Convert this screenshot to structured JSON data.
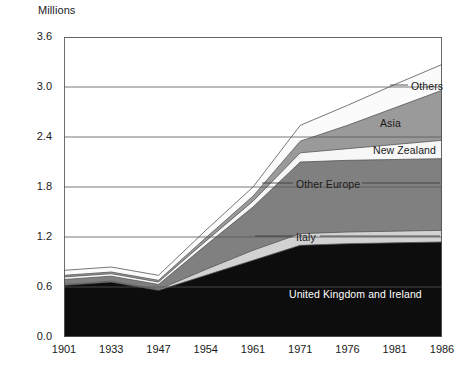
{
  "axis_unit_label": "Millions",
  "y_ticks": [
    "0.0",
    "0.6",
    "1.2",
    "1.8",
    "2.4",
    "3.0",
    "3.6"
  ],
  "x_ticks": [
    "1901",
    "1933",
    "1947",
    "1954",
    "1961",
    "1971",
    "1976",
    "1981",
    "1986"
  ],
  "series_labels": {
    "uk_ireland": "United Kingdom and Ireland",
    "italy": "Italy",
    "other_europe": "Other Europe",
    "new_zealand": "New Zealand",
    "asia": "Asia",
    "others": "Others"
  },
  "colors": {
    "uk_ireland": "#0d0d0d",
    "italy": "#d2d2d2",
    "other_europe": "#808080",
    "new_zealand": "#f7f7f7",
    "asia": "#9a9a9a",
    "others": "#fbfbfb",
    "gridline": "#555555",
    "axis": "#555555",
    "outline": "#555555"
  },
  "chart_data": {
    "type": "area",
    "stacked": true,
    "title": "",
    "subtitle": "",
    "xlabel": "",
    "ylabel": "Millions",
    "ylim": [
      0.0,
      3.6
    ],
    "ytick_step": 0.6,
    "grid": true,
    "legend": "inline-annotations",
    "categories": [
      "1901",
      "1933",
      "1947",
      "1954",
      "1961",
      "1971",
      "1976",
      "1981",
      "1986"
    ],
    "series": [
      {
        "name": "United Kingdom and Ireland",
        "values": [
          0.62,
          0.66,
          0.56,
          0.74,
          0.92,
          1.1,
          1.12,
          1.13,
          1.14
        ]
      },
      {
        "name": "Italy",
        "values": [
          0.01,
          0.01,
          0.01,
          0.07,
          0.12,
          0.14,
          0.14,
          0.14,
          0.14
        ]
      },
      {
        "name": "Other Europe",
        "values": [
          0.06,
          0.06,
          0.06,
          0.29,
          0.52,
          0.86,
          0.86,
          0.86,
          0.86
        ]
      },
      {
        "name": "New Zealand",
        "values": [
          0.03,
          0.03,
          0.03,
          0.05,
          0.07,
          0.11,
          0.14,
          0.18,
          0.22
        ]
      },
      {
        "name": "Asia",
        "values": [
          0.02,
          0.02,
          0.02,
          0.04,
          0.06,
          0.14,
          0.28,
          0.44,
          0.6
        ]
      },
      {
        "name": "Others",
        "values": [
          0.06,
          0.06,
          0.06,
          0.09,
          0.11,
          0.19,
          0.24,
          0.28,
          0.31
        ]
      }
    ],
    "totals": [
      0.8,
      0.84,
      0.74,
      1.28,
      1.8,
      2.54,
      2.78,
      3.03,
      3.27
    ]
  },
  "annotations": [
    {
      "text": "Others",
      "leader": "left"
    },
    {
      "text": "Asia",
      "leader": "none"
    },
    {
      "text": "New Zealand",
      "leader": "none"
    },
    {
      "text": "Other Europe",
      "leader": "both"
    },
    {
      "text": "Italy",
      "leader": "both"
    },
    {
      "text": "United Kingdom and Ireland",
      "leader": "none"
    }
  ]
}
